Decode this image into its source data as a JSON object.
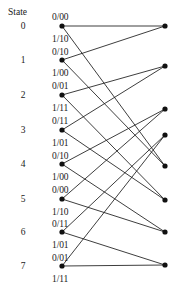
{
  "figure": {
    "title": "",
    "state_header": "State",
    "num_states": 8,
    "left_node_x": 62,
    "right_node_x": 165,
    "node_radius": 2.6,
    "colors": {
      "line": "#1b1b1b",
      "node": "#111111",
      "text": "#1a1a1a",
      "background": "#ffffff"
    }
  },
  "states": [
    {
      "index": 0,
      "label": "0",
      "y": 26,
      "label_y": 22
    },
    {
      "index": 1,
      "label": "1",
      "y": 60,
      "label_y": 56
    },
    {
      "index": 2,
      "label": "2",
      "y": 95,
      "label_y": 91
    },
    {
      "index": 3,
      "label": "3",
      "y": 130,
      "label_y": 126
    },
    {
      "index": 4,
      "label": "4",
      "y": 164,
      "label_y": 160
    },
    {
      "index": 5,
      "label": "5",
      "y": 199,
      "label_y": 195
    },
    {
      "index": 6,
      "label": "6",
      "y": 232,
      "label_y": 228
    },
    {
      "index": 7,
      "label": "7",
      "y": 266,
      "label_y": 262
    }
  ],
  "right_nodes": [
    {
      "index": 0,
      "y": 26
    },
    {
      "index": 1,
      "y": 66
    },
    {
      "index": 2,
      "y": 109
    },
    {
      "index": 3,
      "y": 135
    },
    {
      "index": 4,
      "y": 166
    },
    {
      "index": 5,
      "y": 200
    },
    {
      "index": 6,
      "y": 232
    },
    {
      "index": 7,
      "y": 265
    }
  ],
  "branch_labels": [
    {
      "text": "0/00",
      "x": 52,
      "y": 13
    },
    {
      "text": "1/10",
      "x": 52,
      "y": 35
    },
    {
      "text": "0/10",
      "x": 52,
      "y": 48
    },
    {
      "text": "1/00",
      "x": 52,
      "y": 69
    },
    {
      "text": "0/01",
      "x": 52,
      "y": 82
    },
    {
      "text": "1/11",
      "x": 52,
      "y": 104
    },
    {
      "text": "0/11",
      "x": 52,
      "y": 117
    },
    {
      "text": "1/01",
      "x": 52,
      "y": 139
    },
    {
      "text": "0/10",
      "x": 52,
      "y": 152
    },
    {
      "text": "1/00",
      "x": 52,
      "y": 173
    },
    {
      "text": "0/00",
      "x": 52,
      "y": 186
    },
    {
      "text": "1/10",
      "x": 52,
      "y": 208
    },
    {
      "text": "0/11",
      "x": 52,
      "y": 220
    },
    {
      "text": "1/01",
      "x": 52,
      "y": 241
    },
    {
      "text": "0/01",
      "x": 52,
      "y": 254
    },
    {
      "text": "1/11",
      "x": 52,
      "y": 275
    }
  ],
  "transitions": [
    {
      "from": 0,
      "to": 0,
      "input": "0",
      "output": "00"
    },
    {
      "from": 0,
      "to": 4,
      "input": "1",
      "output": "10"
    },
    {
      "from": 1,
      "to": 0,
      "input": "0",
      "output": "10"
    },
    {
      "from": 1,
      "to": 4,
      "input": "1",
      "output": "00"
    },
    {
      "from": 2,
      "to": 1,
      "input": "0",
      "output": "01"
    },
    {
      "from": 2,
      "to": 5,
      "input": "1",
      "output": "11"
    },
    {
      "from": 3,
      "to": 1,
      "input": "0",
      "output": "11"
    },
    {
      "from": 3,
      "to": 5,
      "input": "1",
      "output": "01"
    },
    {
      "from": 4,
      "to": 2,
      "input": "0",
      "output": "10"
    },
    {
      "from": 4,
      "to": 6,
      "input": "1",
      "output": "00"
    },
    {
      "from": 5,
      "to": 2,
      "input": "0",
      "output": "00"
    },
    {
      "from": 5,
      "to": 6,
      "input": "1",
      "output": "10"
    },
    {
      "from": 6,
      "to": 3,
      "input": "0",
      "output": "11"
    },
    {
      "from": 6,
      "to": 7,
      "input": "1",
      "output": "01"
    },
    {
      "from": 7,
      "to": 3,
      "input": "0",
      "output": "01"
    },
    {
      "from": 7,
      "to": 7,
      "input": "1",
      "output": "11"
    }
  ],
  "header_position": {
    "x": 8,
    "y": 8
  }
}
